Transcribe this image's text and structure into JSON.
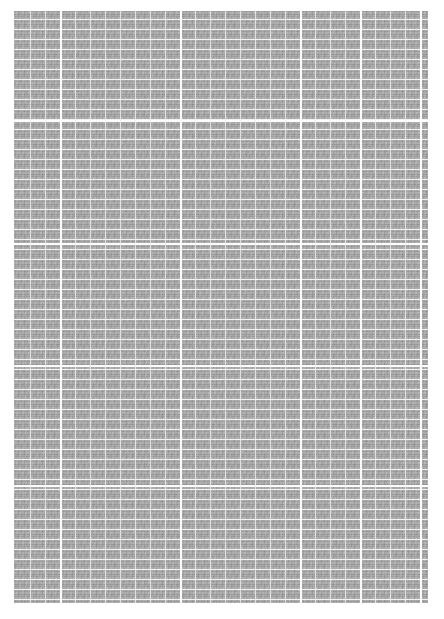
{
  "page": {
    "kind": "scanned-table-page",
    "background_color": "#ffffff",
    "width": 444,
    "height": 619
  },
  "table": {
    "name": "data-table",
    "fill_color": "#a9a9a9",
    "gridline_color": "#f2f2f2",
    "major_gridline_color": "#fdfdfd",
    "frame_color": "#ffffff",
    "bounds": {
      "left": 12,
      "top": 9,
      "width": 418,
      "height": 596
    },
    "legibility": "illegible",
    "row_count": 60,
    "column_count": 28,
    "row_pitch_px": 10,
    "column_pitch_px": 15,
    "section_divider_rows_y": [
      120,
      243,
      365,
      485
    ],
    "major_column_divider_x": [
      60,
      180,
      300,
      360,
      420
    ],
    "minor_column_divider_x": [
      30,
      45,
      75,
      90,
      105,
      120,
      135,
      150,
      165,
      195,
      210,
      225,
      240,
      255,
      270,
      285,
      315,
      330,
      345,
      375,
      390,
      405
    ],
    "sections": [
      {
        "name": "section-1",
        "top": 9,
        "bottom": 120
      },
      {
        "name": "section-2",
        "top": 120,
        "bottom": 243
      },
      {
        "name": "section-3",
        "top": 243,
        "bottom": 365
      },
      {
        "name": "section-4",
        "top": 365,
        "bottom": 485
      },
      {
        "name": "section-5",
        "top": 485,
        "bottom": 605
      }
    ]
  },
  "caption": {
    "name": "table-caption",
    "line1": "",
    "line2": "",
    "color": "#ececec",
    "legibility": "illegible"
  }
}
